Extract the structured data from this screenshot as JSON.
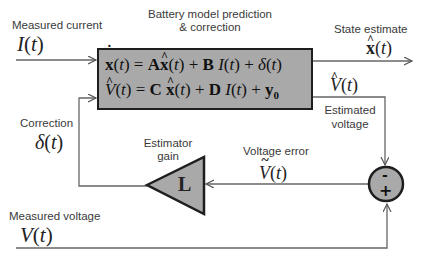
{
  "labels": {
    "measured_current": "Measured current",
    "box_title_line1": "Battery model prediction",
    "box_title_line2": "& correction",
    "state_estimate": "State estimate",
    "estimated_voltage_line1": "Estimated",
    "estimated_voltage_line2": "voltage",
    "correction": "Correction",
    "estimator_gain_line1": "Estimator",
    "estimator_gain_line2": "gain",
    "voltage_error": "Voltage error",
    "measured_voltage": "Measured voltage"
  },
  "symbols": {
    "current": "I(t)",
    "state_hat": "x̂(t)",
    "voltage_hat": "V̂(t)",
    "correction_delta": "δ(t)",
    "gain": "L",
    "voltage_error": "Ṽ(t)",
    "measured_voltage": "V(t)",
    "sum_minus": "-",
    "sum_plus": "+"
  },
  "equations": {
    "state_eq": "x̂̇(t) = A x̂(t) + B I(t) + δ(t)",
    "output_eq": "V̂(t) = C x̂(t) + D I(t) + y₀"
  },
  "colors": {
    "block_fill": "#a9a9a9",
    "block_border": "#1e1e1e",
    "line": "#5a5a5a",
    "background": "#ffffff"
  }
}
